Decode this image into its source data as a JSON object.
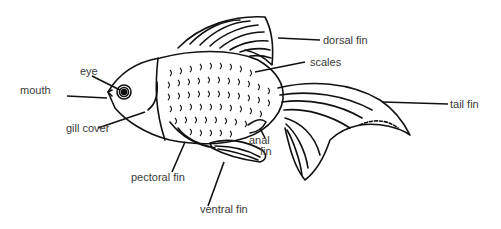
{
  "diagram": {
    "labels": {
      "eye": "eye",
      "mouth": "mouth",
      "gill_cover": "gill cover",
      "dorsal_fin": "dorsal fin",
      "scales": "scales",
      "tail_fin": "tail fin",
      "anal_fin_line1": "anal",
      "anal_fin_line2": "fin",
      "pectoral_fin": "pectoral fin",
      "ventral_fin": "ventral fin"
    },
    "colors": {
      "ink": "#111111",
      "label_text": "#3a3a3a",
      "background": "#ffffff"
    }
  }
}
